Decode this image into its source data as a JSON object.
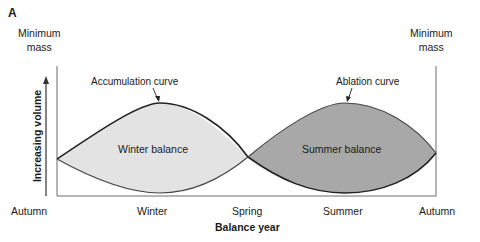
{
  "figure": {
    "panel_label": "A",
    "left_marker": {
      "line1": "Minimum",
      "line2": "mass"
    },
    "right_marker": {
      "line1": "Minimum",
      "line2": "mass"
    },
    "x_axis": {
      "title": "Balance year",
      "ticks": [
        "Autumn",
        "Winter",
        "Spring",
        "Summer",
        "Autumn"
      ]
    },
    "y_axis": {
      "title": "Increasing volume"
    },
    "curves": {
      "accumulation": "Accumulation curve",
      "ablation": "Ablation curve"
    },
    "areas": {
      "winter": "Winter balance",
      "summer": "Summer balance"
    },
    "colors": {
      "winter_fill": "#e3e3e3",
      "summer_fill": "#a8a8a8",
      "line": "#2a2a2a",
      "axis": "#6b6b6b"
    }
  }
}
